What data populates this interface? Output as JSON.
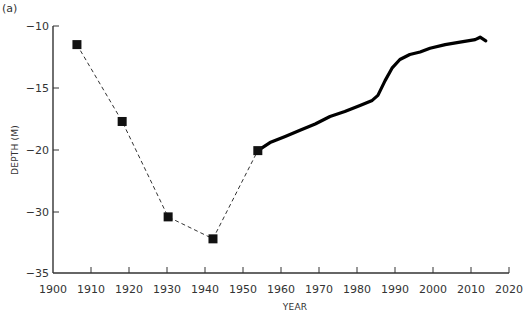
{
  "panel_label": "(a)",
  "chart_data": {
    "type": "line",
    "title": "",
    "xlabel": "YEAR",
    "ylabel": "DEPTH (M)",
    "xlim": [
      1900,
      2020
    ],
    "x_ticks": [
      1900,
      1910,
      1920,
      1930,
      1940,
      1950,
      1960,
      1970,
      1980,
      1990,
      2000,
      2010,
      2020
    ],
    "y_ticks": [
      -10,
      -15,
      -20,
      -30,
      -35
    ],
    "y_axis_note": "non-linear (broken) y scale: equally spaced ticks at -10, -15, -20, -30, -35",
    "grid": false,
    "legend": null,
    "series": [
      {
        "name": "discrete measurements",
        "style": "dashed line with square markers",
        "color": "#111111",
        "x": [
          1906.3,
          1918.2,
          1930.3,
          1942.1,
          1953.9
        ],
        "y": [
          -11.5,
          -17.7,
          -30.4,
          -32.2,
          -20.1
        ]
      },
      {
        "name": "continuous record",
        "style": "solid thick line",
        "color": "#000000",
        "x": [
          1953.9,
          1957.1,
          1961.1,
          1965.0,
          1969.0,
          1972.9,
          1976.8,
          1980.8,
          1984.0,
          1985.5,
          1987.4,
          1989.2,
          1991.3,
          1993.9,
          1996.6,
          1999.2,
          2003.2,
          2007.1,
          2011.1,
          2012.4,
          2013.9
        ],
        "y": [
          -20.1,
          -19.4,
          -18.9,
          -18.4,
          -17.9,
          -17.3,
          -16.9,
          -16.4,
          -16.0,
          -15.6,
          -14.4,
          -13.4,
          -12.7,
          -12.3,
          -12.1,
          -11.8,
          -11.5,
          -11.3,
          -11.1,
          -10.9,
          -11.2
        ]
      }
    ]
  }
}
